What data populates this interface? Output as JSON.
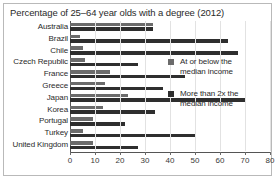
{
  "chart_data": {
    "type": "bar",
    "orientation": "horizontal",
    "title": "Percentage of 25–64 year olds with a degree (2012)",
    "xlabel": "",
    "ylabel": "",
    "xlim": [
      0,
      80
    ],
    "xticks": [
      0,
      10,
      20,
      30,
      40,
      50,
      60,
      70,
      80
    ],
    "grid": true,
    "legend_position": "right",
    "categories": [
      "Australia",
      "Brazil",
      "Chile",
      "Czech Republic",
      "France",
      "Greece",
      "Japan",
      "Korea",
      "Portugal",
      "Turkey",
      "United Kingdom"
    ],
    "series": [
      {
        "name": "At or below the median income",
        "color": "#6b6b6b",
        "values": [
          33,
          4,
          5,
          6,
          16,
          14,
          23,
          13,
          9,
          5,
          9
        ]
      },
      {
        "name": "More than 2x the median income",
        "color": "#2e2e2e",
        "values": [
          33,
          63,
          67,
          27,
          46,
          37,
          70,
          34,
          22,
          50,
          27
        ]
      }
    ]
  },
  "legend": {
    "items": [
      {
        "label_line1": "At or below the",
        "label_line2": "median income",
        "color": "#6b6b6b"
      },
      {
        "label_line1": "More than 2x the",
        "label_line2": "median income",
        "color": "#2e2e2e"
      }
    ]
  }
}
